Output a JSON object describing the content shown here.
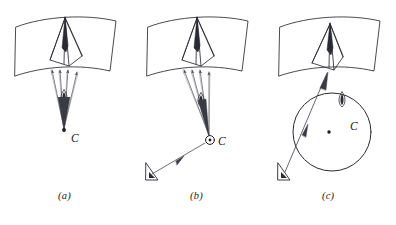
{
  "figure": {
    "width": 396,
    "height": 225,
    "background_color": "#ffffff",
    "stroke_color": "#2a2a33",
    "fill_color": "#ffffff",
    "panel_count": 3
  },
  "panels": [
    {
      "id": "a",
      "caption": "(a)",
      "center_label": "C",
      "center_symbol": "dot",
      "has_viewer": false,
      "has_circle": false,
      "description": "Curved quadrilateral surface with a tall narrow cone apex and a bundle of rays converging downward to point C through a small lens marker."
    },
    {
      "id": "b",
      "caption": "(b)",
      "center_label": "C",
      "center_symbol": "circle-dot",
      "has_viewer": true,
      "viewer_label": "",
      "has_circle": false,
      "description": "Same curved surface and cone, rays converge to a circle-dot marker labelled C, with an external viewer arrow pointing toward C."
    },
    {
      "id": "c",
      "caption": "(c)",
      "center_label": "C",
      "center_symbol": "dot",
      "has_viewer": true,
      "has_circle": true,
      "circle_radius": 40,
      "description": "Curved surface with cone, a large circle centred on a dot labelled C, a small flame/lens marker above the circle and a single ray from an external viewer through the circle to the surface."
    }
  ],
  "colors": {
    "stroke": "#2a2a33",
    "ray_stroke": "#4a4a55",
    "light_stroke": "#8a8a92",
    "background": "#ffffff",
    "text": "#1a1a1a"
  }
}
